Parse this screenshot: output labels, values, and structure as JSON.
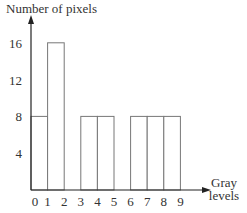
{
  "chart_data": {
    "type": "bar",
    "title": "",
    "xlabel": "Gray levels",
    "xlabel_lines": [
      "Gray",
      "levels"
    ],
    "ylabel": "Number of pixels",
    "categories": [
      "0",
      "1",
      "2",
      "3",
      "4",
      "5",
      "6",
      "7",
      "8"
    ],
    "x_tick_labels": [
      "0",
      "1",
      "2",
      "3",
      "4",
      "5",
      "6",
      "7",
      "8",
      "9"
    ],
    "values": [
      8,
      16,
      0,
      8,
      8,
      0,
      8,
      8,
      8
    ],
    "y_ticks": [
      4,
      8,
      12,
      16
    ],
    "ylim": [
      0,
      18
    ],
    "xlim": [
      0,
      9
    ],
    "grid": false,
    "legend": null,
    "colors": {
      "axis": "#222222",
      "bar_stroke": "#777777",
      "bar_fill": "#ffffff"
    }
  }
}
